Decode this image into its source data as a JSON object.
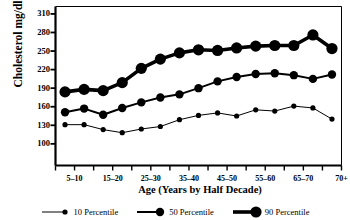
{
  "chart_data": {
    "type": "line",
    "title": "",
    "xlabel": "Age (Years by Half Decade)",
    "ylabel": "Cholesterol mg/dl",
    "ylim": [
      65,
      322
    ],
    "yticks": [
      100,
      130,
      160,
      190,
      220,
      250,
      280,
      310
    ],
    "xtick_labels": [
      "5–10",
      "15–20",
      "25–30",
      "35–40",
      "45–50",
      "55–60",
      "65–70",
      "70+"
    ],
    "x": [
      1,
      2,
      3,
      4,
      5,
      6,
      7,
      8,
      9,
      10,
      11,
      12,
      13,
      14,
      15
    ],
    "grid": false,
    "legend_position": "bottom",
    "series": [
      {
        "name": "10 Percentile",
        "values": [
          131,
          131,
          123,
          118,
          124,
          128,
          139,
          146,
          150,
          145,
          155,
          153,
          161,
          158,
          140
        ],
        "line_width": 1,
        "marker_size": 2.6
      },
      {
        "name": "50 Percentile",
        "values": [
          151,
          157,
          147,
          158,
          167,
          175,
          180,
          190,
          201,
          208,
          213,
          214,
          211,
          205,
          212
        ],
        "line_width": 2,
        "marker_size": 4.2
      },
      {
        "name": "90 Percentile",
        "values": [
          184,
          188,
          186,
          199,
          222,
          237,
          247,
          252,
          251,
          255,
          258,
          259,
          259,
          276,
          254
        ],
        "line_width": 3.6,
        "marker_size": 5.6
      }
    ]
  },
  "axis": {
    "tick_labels_y": [
      "310",
      "280",
      "250",
      "220",
      "190",
      "160",
      "130",
      "100"
    ]
  },
  "legend": {
    "items": [
      {
        "label": "10 Percentile"
      },
      {
        "label": "50 Percentile"
      },
      {
        "label": "90 Percentile"
      }
    ]
  },
  "colors": {
    "line": "#000000",
    "background": "#ffffff",
    "axis": "#000000"
  }
}
